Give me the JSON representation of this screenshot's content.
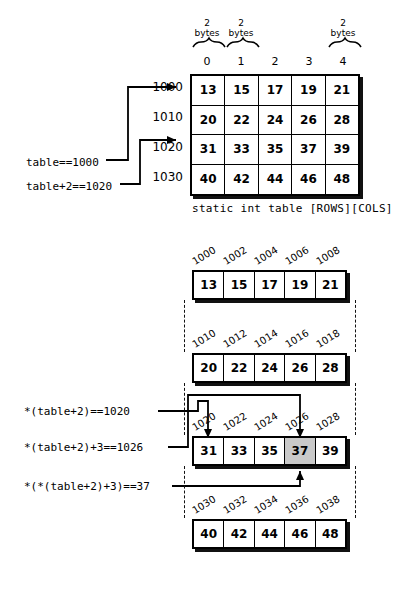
{
  "figure": {
    "caption": "static int table [ROWS][COLS]"
  },
  "top_table": {
    "column_indices": [
      "0",
      "1",
      "2",
      "3",
      "4"
    ],
    "byte_labels": [
      {
        "col": 0,
        "line1": "2",
        "line2": "bytes"
      },
      {
        "col": 1,
        "line1": "2",
        "line2": "bytes"
      },
      {
        "col": 4,
        "line1": "2",
        "line2": "bytes"
      }
    ],
    "row_addresses": [
      "1000",
      "1010",
      "1020",
      "1030"
    ],
    "rows": [
      [
        "13",
        "15",
        "17",
        "19",
        "21"
      ],
      [
        "20",
        "22",
        "24",
        "26",
        "28"
      ],
      [
        "31",
        "33",
        "35",
        "37",
        "39"
      ],
      [
        "40",
        "42",
        "44",
        "46",
        "48"
      ]
    ],
    "pointer_labels": [
      {
        "text": "table==1000",
        "target": "1000"
      },
      {
        "text": "table+2==1020",
        "target": "1020"
      }
    ]
  },
  "memory_blocks": [
    {
      "addresses": [
        "1000",
        "1002",
        "1004",
        "1006",
        "1008"
      ],
      "values": [
        "13",
        "15",
        "17",
        "19",
        "21"
      ],
      "highlight_index": -1
    },
    {
      "addresses": [
        "1010",
        "1012",
        "1014",
        "1016",
        "1018"
      ],
      "values": [
        "20",
        "22",
        "24",
        "26",
        "28"
      ],
      "highlight_index": -1
    },
    {
      "addresses": [
        "1020",
        "1022",
        "1024",
        "1026",
        "1028"
      ],
      "values": [
        "31",
        "33",
        "35",
        "37",
        "39"
      ],
      "highlight_index": 3
    },
    {
      "addresses": [
        "1030",
        "1032",
        "1034",
        "1036",
        "1038"
      ],
      "values": [
        "40",
        "42",
        "44",
        "46",
        "48"
      ],
      "highlight_index": -1
    }
  ],
  "expressions": [
    {
      "text": "*(table+2)==1020",
      "target": "1020"
    },
    {
      "text": "*(table+2)+3==1026",
      "target": "1026"
    },
    {
      "text": "*(*(table+2)+3)==37",
      "target": "37"
    }
  ],
  "colors": {
    "highlight": "#c9c9c9",
    "stroke": "#000000",
    "background": "#ffffff"
  }
}
